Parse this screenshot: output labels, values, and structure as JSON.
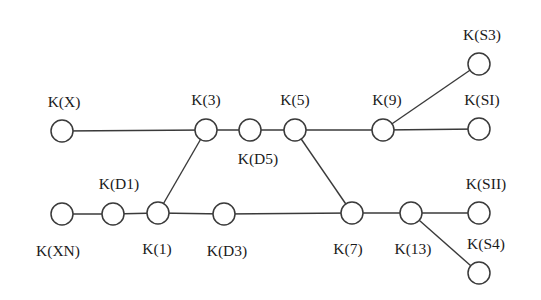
{
  "diagram": {
    "type": "graph",
    "colors": {
      "line": "#3a3a3a",
      "node_fill": "#ffffff",
      "text": "#1a1a1a"
    },
    "nodes": [
      {
        "id": "X",
        "label": "K(X)",
        "x": 62,
        "y": 131,
        "lx": 64,
        "ly": 107,
        "anchor": "middle"
      },
      {
        "id": "3",
        "label": "K(3)",
        "x": 206,
        "y": 130,
        "lx": 206,
        "ly": 105,
        "anchor": "middle"
      },
      {
        "id": "D5",
        "label": "K(D5)",
        "x": 250,
        "y": 130,
        "lx": 258,
        "ly": 164,
        "anchor": "middle"
      },
      {
        "id": "5",
        "label": "K(5)",
        "x": 295,
        "y": 130,
        "lx": 295,
        "ly": 105,
        "anchor": "middle"
      },
      {
        "id": "9",
        "label": "K(9)",
        "x": 383,
        "y": 130,
        "lx": 387,
        "ly": 105,
        "anchor": "middle"
      },
      {
        "id": "SI",
        "label": "K(SI)",
        "x": 479,
        "y": 129,
        "lx": 482,
        "ly": 105,
        "anchor": "middle"
      },
      {
        "id": "S3",
        "label": "K(S3)",
        "x": 479,
        "y": 64,
        "lx": 482,
        "ly": 40,
        "anchor": "middle"
      },
      {
        "id": "XN",
        "label": "K(XN)",
        "x": 62,
        "y": 214,
        "lx": 58,
        "ly": 256,
        "anchor": "middle"
      },
      {
        "id": "D1",
        "label": "K(D1)",
        "x": 113,
        "y": 214,
        "lx": 119,
        "ly": 189,
        "anchor": "middle"
      },
      {
        "id": "1",
        "label": "K(1)",
        "x": 158,
        "y": 213,
        "lx": 157,
        "ly": 254,
        "anchor": "middle"
      },
      {
        "id": "D3",
        "label": "K(D3)",
        "x": 224,
        "y": 214,
        "lx": 227,
        "ly": 256,
        "anchor": "middle"
      },
      {
        "id": "7",
        "label": "K(7)",
        "x": 352,
        "y": 213,
        "lx": 348,
        "ly": 254,
        "anchor": "middle"
      },
      {
        "id": "13",
        "label": "K(13)",
        "x": 411,
        "y": 213,
        "lx": 413,
        "ly": 254,
        "anchor": "middle"
      },
      {
        "id": "SII",
        "label": "K(SII)",
        "x": 479,
        "y": 213,
        "lx": 486,
        "ly": 189,
        "anchor": "middle"
      },
      {
        "id": "S4",
        "label": "K(S4)",
        "x": 479,
        "y": 273,
        "lx": 486,
        "ly": 249,
        "anchor": "middle"
      }
    ],
    "edges": [
      [
        "X",
        "3"
      ],
      [
        "3",
        "D5"
      ],
      [
        "D5",
        "5"
      ],
      [
        "5",
        "9"
      ],
      [
        "9",
        "SI"
      ],
      [
        "9",
        "S3"
      ],
      [
        "XN",
        "D1"
      ],
      [
        "D1",
        "1"
      ],
      [
        "1",
        "D3"
      ],
      [
        "D3",
        "7"
      ],
      [
        "7",
        "13"
      ],
      [
        "13",
        "SII"
      ],
      [
        "13",
        "S4"
      ],
      [
        "1",
        "3"
      ],
      [
        "5",
        "7"
      ]
    ],
    "node_radius": 11
  }
}
